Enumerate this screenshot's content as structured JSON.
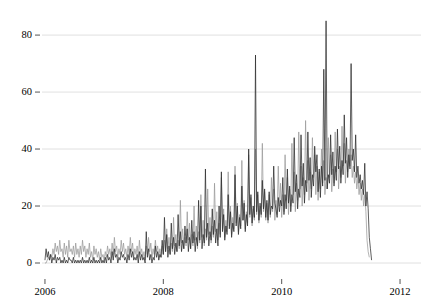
{
  "chart_data": {
    "type": "line",
    "title": "",
    "subtitle": "",
    "xlabel": "",
    "ylabel": "",
    "xlim": [
      2005.95,
      2012.05
    ],
    "ylim": [
      0,
      86
    ],
    "grid": true,
    "grid_axis": "y",
    "legend": "none",
    "x_ticks": [
      2006,
      2008,
      2010,
      2012
    ],
    "x_tick_labels": [
      "2006",
      "2008",
      "2010",
      "2012"
    ],
    "y_ticks": [
      0,
      20,
      40,
      60,
      80
    ],
    "y_tick_labels": [
      "0",
      "20",
      "40",
      "60",
      "80"
    ],
    "colors": {
      "series_dark": "#2b2b2b",
      "series_light": "#9a9a9a",
      "grid": "#d8d8d8",
      "axis": "#555555",
      "background": "#ffffff"
    },
    "annotations": [
      {
        "text": "peak 85 near 2011.0",
        "x": 2010.98,
        "y": 85
      },
      {
        "text": "peak 73 near 2009.5",
        "x": 2009.47,
        "y": 73
      },
      {
        "text": "peak 70 near 2011.55",
        "x": 2011.55,
        "y": 70
      }
    ],
    "series": [
      {
        "name": "series-light",
        "color": "#9a9a9a",
        "x_start": 2006.0,
        "x_step": 0.019230769,
        "values": [
          0,
          0,
          1,
          2,
          1,
          3,
          2,
          5,
          3,
          7,
          4,
          6,
          3,
          8,
          4,
          5,
          2,
          7,
          3,
          6,
          2,
          8,
          4,
          5,
          3,
          6,
          2,
          7,
          3,
          5,
          2,
          6,
          3,
          8,
          4,
          6,
          2,
          5,
          3,
          7,
          2,
          4,
          1,
          6,
          3,
          5,
          2,
          4,
          1,
          5,
          2,
          3,
          1,
          4,
          2,
          6,
          3,
          5,
          2,
          7,
          3,
          9,
          4,
          6,
          2,
          5,
          3,
          8,
          4,
          7,
          3,
          5,
          2,
          6,
          3,
          9,
          4,
          7,
          2,
          5,
          3,
          6,
          2,
          8,
          3,
          5,
          2,
          4,
          1,
          6,
          3,
          9,
          4,
          7,
          2,
          5,
          3,
          8,
          4,
          6,
          2,
          5,
          2,
          6,
          3,
          8,
          4,
          12,
          5,
          9,
          3,
          7,
          4,
          16,
          6,
          10,
          4,
          8,
          5,
          22,
          7,
          12,
          5,
          9,
          6,
          18,
          8,
          14,
          5,
          10,
          6,
          20,
          8,
          13,
          5,
          11,
          7,
          24,
          9,
          15,
          6,
          12,
          8,
          26,
          10,
          16,
          7,
          13,
          9,
          28,
          11,
          18,
          8,
          14,
          10,
          30,
          12,
          19,
          9,
          15,
          11,
          32,
          13,
          20,
          10,
          16,
          12,
          34,
          14,
          21,
          11,
          17,
          13,
          36,
          15,
          22,
          12,
          18,
          14,
          38,
          16,
          23,
          13,
          19,
          15,
          40,
          17,
          24,
          14,
          20,
          16,
          42,
          18,
          25,
          15,
          21,
          14,
          24,
          16,
          30,
          18,
          26,
          15,
          22,
          17,
          34,
          20,
          28,
          16,
          24,
          18,
          38,
          22,
          30,
          17,
          26,
          20,
          42,
          24,
          32,
          18,
          28,
          22,
          46,
          26,
          34,
          20,
          30,
          24,
          50,
          28,
          36,
          22,
          32,
          26,
          44,
          30,
          38,
          24,
          34,
          22,
          32,
          26,
          40,
          28,
          36,
          24,
          30,
          26,
          44,
          30,
          38,
          25,
          33,
          28,
          46,
          32,
          40,
          26,
          34,
          30,
          48,
          34,
          42,
          28,
          36,
          32,
          40,
          34,
          38,
          30,
          34,
          28,
          32,
          26,
          30,
          24,
          28,
          22,
          26,
          20,
          24,
          18,
          8,
          4,
          2
        ]
      },
      {
        "name": "series-dark",
        "color": "#2b2b2b",
        "x_start": 2006.0,
        "x_step": 0.019230769,
        "values": [
          1,
          5,
          2,
          4,
          1,
          3,
          0,
          2,
          1,
          3,
          0,
          2,
          1,
          2,
          0,
          1,
          0,
          2,
          0,
          1,
          0,
          2,
          1,
          1,
          0,
          2,
          0,
          1,
          0,
          1,
          0,
          1,
          0,
          2,
          0,
          1,
          0,
          1,
          0,
          2,
          0,
          1,
          0,
          2,
          0,
          1,
          0,
          1,
          0,
          2,
          0,
          1,
          0,
          2,
          0,
          3,
          1,
          2,
          0,
          4,
          1,
          5,
          2,
          3,
          0,
          2,
          1,
          4,
          2,
          3,
          1,
          2,
          0,
          3,
          1,
          5,
          2,
          4,
          1,
          2,
          1,
          3,
          0,
          4,
          1,
          3,
          1,
          2,
          0,
          11,
          2,
          5,
          1,
          3,
          0,
          2,
          1,
          6,
          2,
          4,
          1,
          3,
          2,
          8,
          3,
          16,
          4,
          10,
          2,
          6,
          3,
          14,
          5,
          9,
          3,
          7,
          4,
          17,
          6,
          11,
          4,
          8,
          5,
          13,
          7,
          12,
          4,
          9,
          5,
          15,
          7,
          11,
          4,
          9,
          6,
          22,
          8,
          20,
          5,
          10,
          7,
          33,
          9,
          14,
          6,
          11,
          8,
          19,
          10,
          15,
          7,
          12,
          6,
          20,
          9,
          32,
          11,
          17,
          8,
          13,
          10,
          24,
          12,
          18,
          9,
          14,
          11,
          31,
          13,
          20,
          10,
          16,
          12,
          27,
          15,
          21,
          11,
          17,
          13,
          40,
          17,
          24,
          14,
          20,
          16,
          73,
          18,
          25,
          15,
          21,
          17,
          29,
          19,
          26,
          16,
          22,
          15,
          25,
          17,
          20,
          19,
          34,
          21,
          19,
          16,
          23,
          18,
          22,
          20,
          30,
          17,
          24,
          19,
          33,
          21,
          27,
          18,
          24,
          21,
          44,
          25,
          31,
          19,
          26,
          23,
          45,
          27,
          35,
          21,
          29,
          25,
          46,
          29,
          37,
          23,
          31,
          27,
          41,
          32,
          38,
          25,
          33,
          23,
          34,
          27,
          68,
          29,
          85,
          26,
          31,
          28,
          45,
          31,
          39,
          27,
          34,
          29,
          47,
          33,
          41,
          28,
          36,
          31,
          52,
          35,
          44,
          30,
          38,
          33,
          70,
          36,
          40,
          32,
          45,
          30,
          34,
          28,
          31,
          26,
          29,
          24,
          35,
          20,
          25,
          19,
          9,
          5,
          1
        ]
      }
    ]
  },
  "yaxis": {
    "ticks": [
      {
        "label": "80",
        "value": 80
      },
      {
        "label": "60",
        "value": 60
      },
      {
        "label": "40",
        "value": 40
      },
      {
        "label": "20",
        "value": 20
      },
      {
        "label": "0",
        "value": 0
      }
    ]
  },
  "xaxis": {
    "ticks": [
      {
        "label": "2006",
        "value": 2006
      },
      {
        "label": "2008",
        "value": 2008
      },
      {
        "label": "2010",
        "value": 2010
      },
      {
        "label": "2012",
        "value": 2012
      }
    ]
  }
}
